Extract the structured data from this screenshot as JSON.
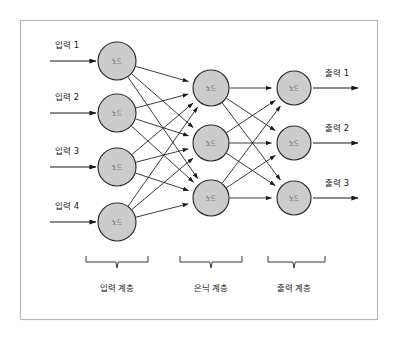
{
  "diagram": {
    "title": "",
    "frame": {
      "x": 20,
      "y": 20,
      "width": 358,
      "height": 300,
      "border_color": "#b9b9b9",
      "background": "#ffffff"
    },
    "node_label": "노드",
    "node_style": {
      "fill": "#cccccc",
      "stroke": "#2b2b2b"
    },
    "edge_color": "#1a1a1a",
    "layers": [
      {
        "id": "input-layer",
        "name": "input",
        "caption": "입력 계층",
        "caption_x": 117,
        "brace": {
          "x1": 86,
          "x2": 148,
          "y": 262,
          "tip_x": 117
        },
        "nodes": [
          {
            "label": "노드",
            "cx": 117,
            "cy": 61,
            "r": 19
          },
          {
            "label": "노드",
            "cx": 117,
            "cy": 113,
            "r": 19
          },
          {
            "label": "노드",
            "cx": 117,
            "cy": 167,
            "r": 19
          },
          {
            "label": "노드",
            "cx": 117,
            "cy": 222,
            "r": 19
          }
        ]
      },
      {
        "id": "hidden-layer",
        "name": "hidden",
        "caption": "은닉 계층",
        "caption_x": 211,
        "brace": {
          "x1": 180,
          "x2": 242,
          "y": 262,
          "tip_x": 211
        },
        "nodes": [
          {
            "label": "노드",
            "cx": 211,
            "cy": 88,
            "r": 18
          },
          {
            "label": "노드",
            "cx": 211,
            "cy": 143,
            "r": 18
          },
          {
            "label": "노드",
            "cx": 211,
            "cy": 198,
            "r": 18
          }
        ]
      },
      {
        "id": "output-layer",
        "name": "output",
        "caption": "출력 계층",
        "caption_x": 294,
        "brace": {
          "x1": 268,
          "x2": 325,
          "y": 262,
          "tip_x": 294
        },
        "nodes": [
          {
            "label": "노드",
            "cx": 294,
            "cy": 88,
            "r": 17
          },
          {
            "label": "노드",
            "cx": 294,
            "cy": 143,
            "r": 17
          },
          {
            "label": "노드",
            "cx": 294,
            "cy": 198,
            "r": 17
          }
        ]
      }
    ],
    "inputs": [
      {
        "label": "입력 1",
        "text_x": 55,
        "text_y": 48,
        "arrow_y": 61,
        "arrow_x1": 50,
        "arrow_x2": 96
      },
      {
        "label": "입력 2",
        "text_x": 55,
        "text_y": 100,
        "arrow_y": 113,
        "arrow_x1": 50,
        "arrow_x2": 96
      },
      {
        "label": "입력 3",
        "text_x": 55,
        "text_y": 154,
        "arrow_y": 167,
        "arrow_x1": 50,
        "arrow_x2": 96
      },
      {
        "label": "입력 4",
        "text_x": 55,
        "text_y": 209,
        "arrow_y": 222,
        "arrow_x1": 50,
        "arrow_x2": 96
      }
    ],
    "outputs": [
      {
        "label": "출력 1",
        "text_x": 325,
        "text_y": 76,
        "arrow_y": 88,
        "arrow_x1": 313,
        "arrow_x2": 358
      },
      {
        "label": "출력 2",
        "text_x": 325,
        "text_y": 131,
        "arrow_y": 143,
        "arrow_x1": 313,
        "arrow_x2": 358
      },
      {
        "label": "출력 3",
        "text_x": 325,
        "text_y": 186,
        "arrow_y": 198,
        "arrow_x1": 313,
        "arrow_x2": 358
      }
    ],
    "connections": {
      "input_to_hidden": "fully-connected",
      "hidden_to_output": "fully-connected"
    }
  }
}
